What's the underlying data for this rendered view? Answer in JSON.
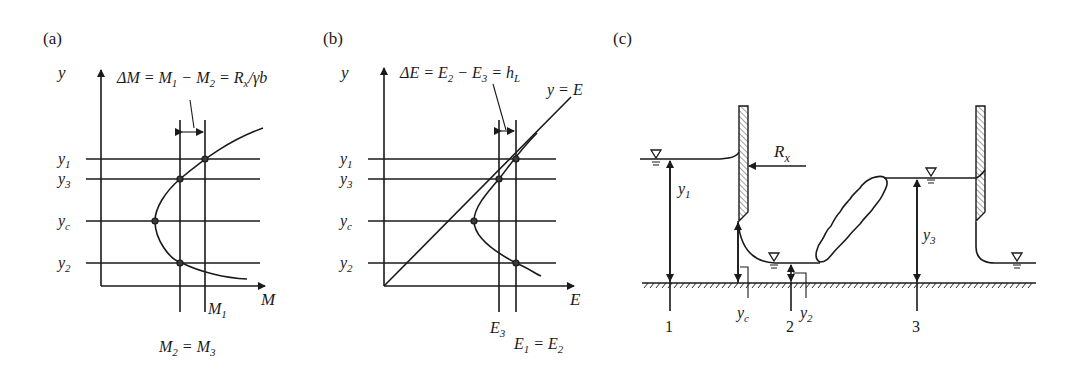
{
  "panels": {
    "a": {
      "label": "(a)",
      "axis_y": "y",
      "axis_x": "M",
      "equation": "ΔM = M₁ − M₂ = Rₓ/γb",
      "y_levels": [
        "y₁",
        "y₃",
        "y_c",
        "y₂"
      ],
      "x_marks": [
        "M₁"
      ],
      "bottom_note": "M₂ = M₃"
    },
    "b": {
      "label": "(b)",
      "axis_y": "y",
      "axis_x": "E",
      "equation": "ΔE = E₂ − E₃ = h_L",
      "diagonal_label": "y = E",
      "y_levels": [
        "y₁",
        "y₃",
        "y_c",
        "y₂"
      ],
      "x_marks": [
        "E₃",
        "E₁ = E₂"
      ]
    },
    "c": {
      "label": "(c)",
      "force_label": "Rₓ",
      "depths": [
        "y₁",
        "y_c",
        "y₂",
        "y₃"
      ],
      "sections": [
        "1",
        "2",
        "3"
      ]
    }
  }
}
